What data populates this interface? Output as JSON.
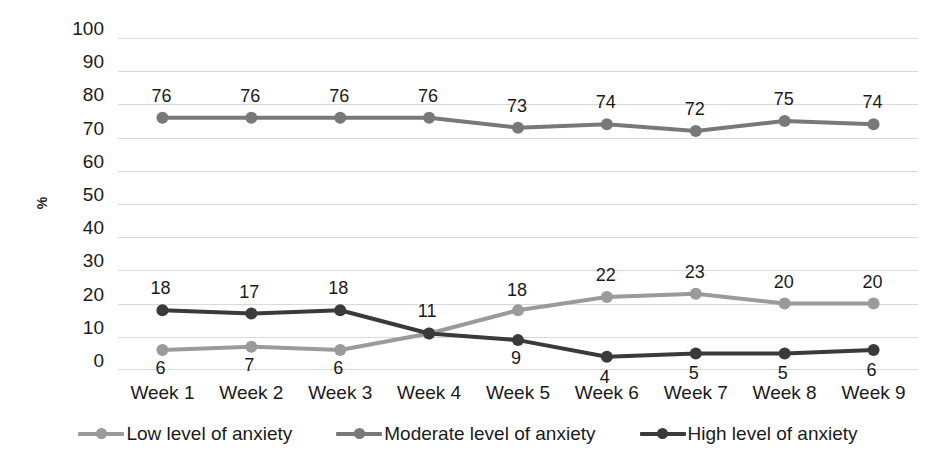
{
  "chart_data": {
    "type": "line",
    "title": "",
    "subtitle": "",
    "xlabel": "",
    "ylabel": "%",
    "categories": [
      "Week 1",
      "Week 2",
      "Week 3",
      "Week 4",
      "Week 5",
      "Week 6",
      "Week 7",
      "Week 8",
      "Week 9"
    ],
    "ylim": [
      0,
      100
    ],
    "ytick_step": 10,
    "yticks": [
      "100",
      "90",
      "80",
      "70",
      "60",
      "50",
      "40",
      "30",
      "20",
      "10",
      "0"
    ],
    "grid": true,
    "grid_axis": "y",
    "legend_position": "bottom",
    "series": [
      {
        "name": "Low level of anxiety",
        "color": "#9a9a9a",
        "values": [
          6,
          7,
          6,
          11,
          18,
          22,
          23,
          20,
          20
        ],
        "labels": [
          "6",
          "7",
          "6",
          "11",
          "18",
          "22",
          "23",
          "20",
          "20"
        ]
      },
      {
        "name": "Moderate level of anxiety",
        "color": "#787878",
        "values": [
          76,
          76,
          76,
          76,
          73,
          74,
          72,
          75,
          74
        ],
        "labels": [
          "76",
          "76",
          "76",
          "76",
          "73",
          "74",
          "72",
          "75",
          "74"
        ]
      },
      {
        "name": "High level of anxiety",
        "color": "#3a3a3a",
        "values": [
          18,
          17,
          18,
          11,
          9,
          4,
          5,
          5,
          6
        ],
        "labels": [
          "18",
          "17",
          "18",
          "11",
          "9",
          "4",
          "5",
          "5",
          "6"
        ]
      }
    ],
    "annotations": {
      "week4_overlap": "Low and High series converge at 11 in Week 4; a single value label is shown."
    }
  },
  "legend": {
    "items": [
      {
        "label": "Low level of anxiety",
        "color": "#9a9a9a"
      },
      {
        "label": "Moderate level of anxiety",
        "color": "#787878"
      },
      {
        "label": "High level of anxiety",
        "color": "#3a3a3a"
      }
    ]
  },
  "colors": {
    "background": "#ffffff",
    "gridline": "#d9d9d9",
    "text": "#1a1a1a",
    "low": "#9a9a9a",
    "moderate": "#787878",
    "high": "#3a3a3a"
  }
}
